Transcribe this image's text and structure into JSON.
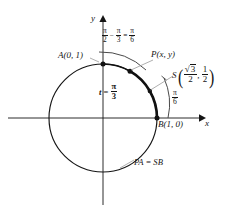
{
  "figure": {
    "type": "unit-circle-diagram",
    "axes": {
      "x_label": "x",
      "y_label": "y",
      "origin_px": [
        103,
        118
      ]
    },
    "circle": {
      "center_px": [
        103,
        118
      ],
      "radius_px": 54,
      "radius_units": 1,
      "stroke": "#151515"
    },
    "points": [
      {
        "id": "A",
        "label": "A(0, 1)",
        "coords": [
          0,
          1
        ],
        "angle_rad": "pi/2",
        "angle_deg": 90,
        "px": [
          103,
          64
        ],
        "marker": "dot"
      },
      {
        "id": "P",
        "label": "P(x, y)",
        "coords": [
          "x",
          "y"
        ],
        "angle_rad": "pi/3",
        "angle_deg": 60,
        "px": [
          130,
          71
        ],
        "marker": "dot"
      },
      {
        "id": "S",
        "label": "S",
        "coords": [
          "sqrt3/2",
          "1/2"
        ],
        "angle_rad": "pi/6",
        "angle_deg": 30,
        "px": [
          150,
          91
        ],
        "marker": "dot"
      },
      {
        "id": "B",
        "label": "B(1, 0)",
        "coords": [
          1,
          0
        ],
        "angle_rad": "0",
        "angle_deg": 0,
        "px": [
          157,
          118
        ],
        "marker": "dot"
      }
    ],
    "labels": {
      "y_axis": "y",
      "x_axis": "x",
      "point_a": "A(0, 1)",
      "point_p": "P(x, y)",
      "point_b": "B(1, 0)",
      "arc_equality": "PA = SB",
      "t_symbol": "t",
      "equals": "=",
      "minus": "−",
      "pi": "π",
      "point_s_name": "S",
      "comma": ",",
      "sqrt_symbol": "√",
      "three": "3"
    },
    "fractions": {
      "pi_over_2": {
        "num": "π",
        "den": "2"
      },
      "pi_over_3": {
        "num": "π",
        "den": "3"
      },
      "pi_over_6": {
        "num": "π",
        "den": "6"
      },
      "t_pi_over_3": {
        "num": "π",
        "den": "3"
      },
      "arc_pi_over_6": {
        "num": "π",
        "den": "6"
      },
      "sqrt3_over_2": {
        "num": "3",
        "den": "2"
      },
      "one_over_2": {
        "num": "1",
        "den": "2"
      }
    },
    "equation_top": "π/2 − π/3 = π/6",
    "arcs": [
      {
        "id": "arc-PA",
        "from_deg": 60,
        "to_deg": 90,
        "style": "thick",
        "meaning": "arc PA"
      },
      {
        "id": "arc-SB",
        "from_deg": 0,
        "to_deg": 30,
        "style": "thick",
        "meaning": "arc SB"
      },
      {
        "id": "arc-t",
        "from_deg": 0,
        "to_deg": 60,
        "style": "thick",
        "meaning": "t = pi/3"
      },
      {
        "id": "arc-indicator-top",
        "style": "thin",
        "meaning": "pi/2 - pi/3 = pi/6 indicator"
      },
      {
        "id": "arc-indicator-right",
        "style": "thin",
        "meaning": "pi/6 indicator"
      }
    ],
    "colors": {
      "stroke": "#151515",
      "background": "#ffffff",
      "leader": "#9a9a9a",
      "thin_arc": "#4a4a4a"
    }
  }
}
